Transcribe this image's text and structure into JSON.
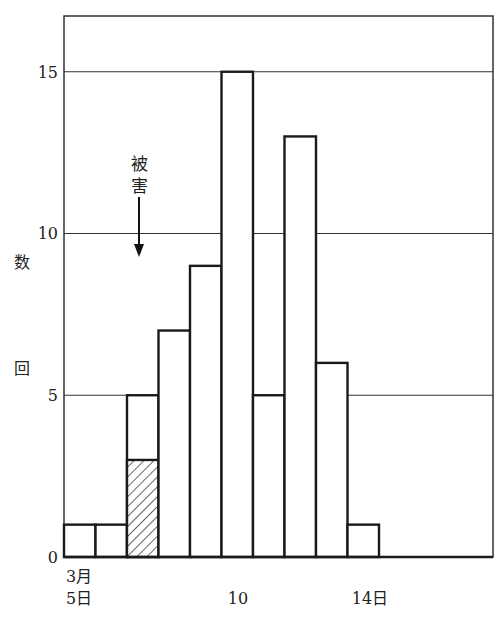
{
  "chart_data": {
    "type": "bar",
    "title": "",
    "xlabel": "",
    "ylabel": "回数",
    "ylim": [
      0,
      17
    ],
    "yticks": [
      0,
      5,
      10,
      15
    ],
    "grid": "horizontal lines at 5, 10, 15",
    "categories": [
      "3月5日",
      "6",
      "7",
      "8",
      "9",
      "10",
      "11",
      "12",
      "13",
      "14日"
    ],
    "x_tick_labels": [
      {
        "label": "3月\n5日",
        "line1": "3月",
        "line2": "5日",
        "x": 5
      },
      {
        "label": "10",
        "x": 10
      },
      {
        "label": "14日",
        "x": 14
      }
    ],
    "series": [
      {
        "name": "total",
        "values": [
          1,
          1,
          5,
          7,
          9,
          15,
          5,
          13,
          6,
          1
        ]
      },
      {
        "name": "damage (hatched)",
        "values": [
          0,
          0,
          3,
          0,
          0,
          0,
          0,
          0,
          0,
          0
        ]
      }
    ],
    "annotations": [
      {
        "text": "被害",
        "arrow": "down",
        "points_to_category": "7"
      }
    ],
    "colors": {
      "line": "#1a1a1a",
      "grid": "#333333",
      "background": "#ffffff"
    }
  },
  "axis": {
    "ylabel_chars": [
      "数",
      "回"
    ],
    "yticks": [
      "15",
      "10",
      "5",
      "0"
    ],
    "x_first_line1": "3月",
    "x_first_line2": "5日",
    "x_mid": "10",
    "x_end": "14日"
  },
  "annotation": {
    "char1": "被",
    "char2": "害"
  }
}
